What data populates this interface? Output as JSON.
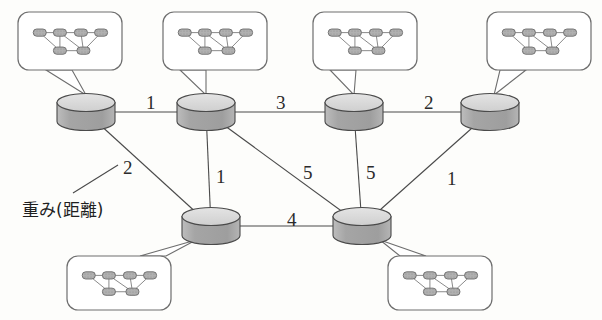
{
  "figure": {
    "title": "",
    "annotation": {
      "text": "重み(距離)",
      "refers_to_weight": "2"
    }
  },
  "colors": {
    "background": "#fdfdfb",
    "stroke": "#4a4a4a",
    "cylinder_top": "#d8d8d8",
    "cylinder_body": "#a9a9a9",
    "bubble_stroke": "#6e6e6e",
    "mini_node_fill": "#c9c9c9",
    "text": "#2b2b2b"
  },
  "graph": {
    "nodes": [
      {
        "id": "n1",
        "name": "domain-node-1",
        "cx": 86,
        "cy": 112,
        "row": "top"
      },
      {
        "id": "n2",
        "name": "domain-node-2",
        "cx": 206,
        "cy": 112,
        "row": "top"
      },
      {
        "id": "n3",
        "name": "domain-node-3",
        "cx": 354,
        "cy": 112,
        "row": "top"
      },
      {
        "id": "n4",
        "name": "domain-node-4",
        "cx": 490,
        "cy": 112,
        "row": "top"
      },
      {
        "id": "n5",
        "name": "domain-node-5",
        "cx": 211,
        "cy": 226,
        "row": "bottom"
      },
      {
        "id": "n6",
        "name": "domain-node-6",
        "cx": 362,
        "cy": 226,
        "row": "bottom"
      }
    ],
    "edges": [
      {
        "from": "n1",
        "to": "n2",
        "weight": "1",
        "lx": 146,
        "ly": 93
      },
      {
        "from": "n2",
        "to": "n3",
        "weight": "3",
        "lx": 276,
        "ly": 93
      },
      {
        "from": "n3",
        "to": "n4",
        "weight": "2",
        "lx": 424,
        "ly": 93
      },
      {
        "from": "n1",
        "to": "n5",
        "weight": "2",
        "lx": 123,
        "ly": 158
      },
      {
        "from": "n2",
        "to": "n5",
        "weight": "1",
        "lx": 216,
        "ly": 167
      },
      {
        "from": "n2",
        "to": "n6",
        "weight": "5",
        "lx": 303,
        "ly": 163
      },
      {
        "from": "n3",
        "to": "n6",
        "weight": "5",
        "lx": 366,
        "ly": 163
      },
      {
        "from": "n4",
        "to": "n6",
        "weight": "1",
        "lx": 447,
        "ly": 169
      },
      {
        "from": "n5",
        "to": "n6",
        "weight": "4",
        "lx": 287,
        "ly": 210
      }
    ]
  },
  "callouts": [
    {
      "id": "c1",
      "name": "callout-node-1",
      "x": 18,
      "y": 12,
      "w": 104,
      "h": 58,
      "tail": [
        [
          46,
          70
        ],
        [
          72,
          70
        ],
        [
          86,
          95
        ]
      ],
      "attach": "n1"
    },
    {
      "id": "c2",
      "name": "callout-node-2",
      "x": 163,
      "y": 12,
      "w": 104,
      "h": 58,
      "tail": [
        [
          180,
          70
        ],
        [
          206,
          70
        ],
        [
          206,
          95
        ]
      ],
      "attach": "n2"
    },
    {
      "id": "c3",
      "name": "callout-node-3",
      "x": 313,
      "y": 12,
      "w": 104,
      "h": 58,
      "tail": [
        [
          330,
          70
        ],
        [
          356,
          70
        ],
        [
          354,
          95
        ]
      ],
      "attach": "n3"
    },
    {
      "id": "c4",
      "name": "callout-node-4",
      "x": 487,
      "y": 12,
      "w": 104,
      "h": 58,
      "tail": [
        [
          500,
          70
        ],
        [
          526,
          70
        ],
        [
          494,
          95
        ]
      ],
      "attach": "n4"
    },
    {
      "id": "c5",
      "name": "callout-node-5",
      "x": 67,
      "y": 256,
      "w": 104,
      "h": 54,
      "tail": [
        [
          140,
          256
        ],
        [
          166,
          256
        ],
        [
          196,
          240
        ]
      ],
      "attach": "n5"
    },
    {
      "id": "c6",
      "name": "callout-node-6",
      "x": 388,
      "y": 256,
      "w": 104,
      "h": 54,
      "tail": [
        [
          400,
          256
        ],
        [
          426,
          256
        ],
        [
          380,
          240
        ]
      ],
      "attach": "n6"
    }
  ],
  "mini_graph": {
    "description": "inner-network-topology",
    "nodes": [
      {
        "id": "a",
        "x": 0.14,
        "y": 0.3
      },
      {
        "id": "b",
        "x": 0.38,
        "y": 0.3
      },
      {
        "id": "c",
        "x": 0.63,
        "y": 0.3
      },
      {
        "id": "d",
        "x": 0.87,
        "y": 0.3
      },
      {
        "id": "e",
        "x": 0.38,
        "y": 0.73
      },
      {
        "id": "f",
        "x": 0.66,
        "y": 0.73
      }
    ],
    "edges": [
      [
        "a",
        "b"
      ],
      [
        "b",
        "c"
      ],
      [
        "c",
        "d"
      ],
      [
        "a",
        "e"
      ],
      [
        "b",
        "e"
      ],
      [
        "b",
        "f"
      ],
      [
        "c",
        "f"
      ],
      [
        "d",
        "f"
      ],
      [
        "e",
        "f"
      ]
    ]
  },
  "annotation_leader": {
    "from": [
      73,
      193
    ],
    "to": [
      118,
      165
    ]
  }
}
